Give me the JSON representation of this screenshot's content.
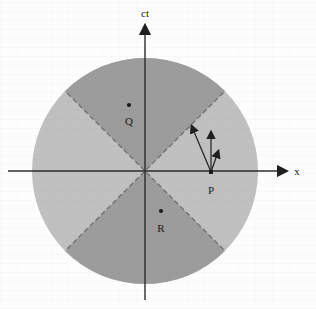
{
  "figure": {
    "background_color": "#fdfdfd",
    "axes": {
      "vertical_label": "ct",
      "horizontal_label": "x",
      "axis_color": "#2b2b2b",
      "origin": {
        "x": 145,
        "y": 171
      }
    },
    "disk": {
      "center_x": 145,
      "center_y": 171,
      "radius": 113,
      "timelike_sector_color": "#9c9c9c",
      "spacelike_sector_color": "#c0c0c0",
      "lightcone_line_color": "#6e6e6e",
      "lightcone_line_style": "dashed"
    },
    "events": [
      {
        "name": "event-q",
        "label": "Q",
        "x": 129,
        "y": 105,
        "label_x": 129,
        "label_y": 121,
        "region": "timelike-future"
      },
      {
        "name": "event-p",
        "label": "P",
        "x": 211,
        "y": 172,
        "label_x": 211,
        "label_y": 190,
        "region": "spacelike-right"
      },
      {
        "name": "event-r",
        "label": "R",
        "x": 161,
        "y": 211,
        "label_x": 161,
        "label_y": 228,
        "region": "timelike-past"
      }
    ],
    "vectors": [
      {
        "name": "vector-left",
        "from_x": 211,
        "from_y": 172,
        "to_x": 192,
        "to_y": 127
      },
      {
        "name": "vector-middle",
        "from_x": 211,
        "from_y": 172,
        "to_x": 211,
        "to_y": 133
      },
      {
        "name": "vector-right",
        "from_x": 211,
        "from_y": 172,
        "to_x": 218,
        "to_y": 152
      }
    ]
  }
}
